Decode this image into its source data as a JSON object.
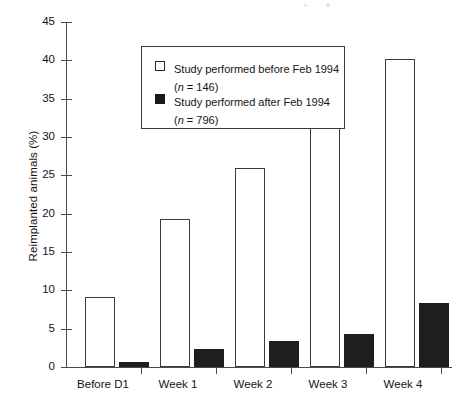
{
  "chart_data": {
    "type": "bar",
    "title": "",
    "subtitle": "",
    "xlabel": "",
    "ylabel": "Reimplanted animals (%)",
    "ylim": [
      0,
      45
    ],
    "ytick_step": 5,
    "yticks": [
      "45",
      "40",
      "35",
      "30",
      "25",
      "20",
      "15",
      "10",
      "5",
      "0"
    ],
    "grid": false,
    "legend_position": "top-left inside plot, boxed",
    "categories": [
      "Before D1",
      "Week 1",
      "Week 2",
      "Week 3",
      "Week 4"
    ],
    "series": [
      {
        "name": "Study performed before Feb 1994",
        "n_label": "(n = 146)",
        "n": 146,
        "style": "open",
        "fill": "#ffffff",
        "edge": "#3a3a3a",
        "values": [
          9.1,
          19.3,
          25.9,
          36.3,
          40.2
        ]
      },
      {
        "name": "Study performed after Feb 1994",
        "n_label": "(n = 796)",
        "n": 796,
        "style": "filled",
        "fill": "#1e1e1e",
        "edge": "#1e1e1e",
        "values": [
          0.7,
          2.4,
          3.4,
          4.3,
          8.3
        ]
      }
    ]
  },
  "legend": {
    "entries": [
      {
        "label": "Study performed before Feb 1994",
        "n_prefix": "(",
        "n_italic": "n",
        "n_suffix": " = 146)"
      },
      {
        "label": "Study performed after Feb 1994",
        "n_prefix": "(",
        "n_italic": "n",
        "n_suffix": " = 796)"
      }
    ]
  },
  "colors": {
    "axis": "#4b4b4b",
    "text": "#141414",
    "open_bar_fill": "#ffffff",
    "open_bar_edge": "#3a3a3a",
    "filled_bar": "#1e1e1e",
    "legend_border": "#3a3a3a",
    "background": "#ffffff"
  }
}
